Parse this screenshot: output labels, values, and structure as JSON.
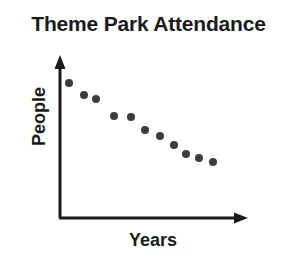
{
  "chart_data": {
    "type": "scatter",
    "title": "Theme Park Attendance",
    "xlabel": "Years",
    "ylabel": "People",
    "grid": false,
    "legend": null,
    "xticks": [],
    "yticks": [],
    "xlim": [
      0,
      11
    ],
    "ylim": [
      0,
      11
    ],
    "axis_style": "arrow-axes-unlabeled",
    "trend": "decreasing",
    "series": [
      {
        "name": "Attendance",
        "color": "#3d3d3d",
        "marker": "circle",
        "points": [
          {
            "x": 0.5,
            "y": 9.2
          },
          {
            "x": 1.4,
            "y": 8.4
          },
          {
            "x": 2.1,
            "y": 8.1
          },
          {
            "x": 3.2,
            "y": 7.0
          },
          {
            "x": 4.2,
            "y": 6.9
          },
          {
            "x": 5.0,
            "y": 6.0
          },
          {
            "x": 5.9,
            "y": 5.6
          },
          {
            "x": 6.7,
            "y": 5.0
          },
          {
            "x": 7.4,
            "y": 4.4
          },
          {
            "x": 8.2,
            "y": 4.1
          },
          {
            "x": 9.0,
            "y": 3.8
          }
        ]
      }
    ]
  },
  "axes": {
    "y_axis_name": "vertical-axis-arrow",
    "x_axis_name": "horizontal-axis-arrow",
    "color": "#1a1a1a"
  },
  "canvas": {
    "background": "#ffffff",
    "width": 297,
    "height": 262,
    "plot_origin_x": 60,
    "plot_origin_y": 218,
    "plot_right_x": 247,
    "plot_top_y": 57
  }
}
